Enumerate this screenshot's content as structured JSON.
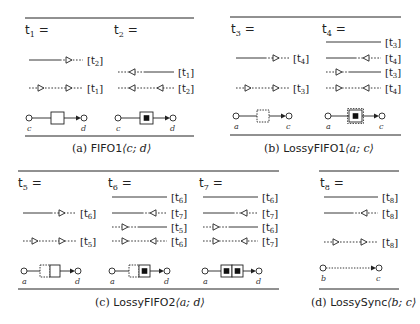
{
  "panels": [
    {
      "id": "a",
      "rule_x": [
        25,
        194
      ],
      "rule_top_y": 18,
      "rule_bottom_y": 136,
      "caption_prefix": "(a) ",
      "caption_name": "FIFO1",
      "caption_args": "⟨c; d⟩",
      "caption_x": 72,
      "caption_y": 152,
      "terms": [
        {
          "label": "t",
          "sub": "1",
          "x": 25,
          "y": 34,
          "rows": [
            {
              "y": 60,
              "x0": 29,
              "x1": 83,
              "pattern": [
                [
                  "solid",
                  29,
                  60
                ],
                [
                  "dot",
                  60,
                  83
                ]
              ],
              "arrows": [
                {
                  "x": 69,
                  "dir": "right"
                }
              ],
              "ref_t": "t",
              "ref_sub": "2",
              "ref_x": 87
            },
            {
              "y": 88,
              "x0": 29,
              "x1": 83,
              "pattern": [
                [
                  "dot",
                  29,
                  83
                ]
              ],
              "arrows": [
                {
                  "x": 41,
                  "dir": "right"
                },
                {
                  "x": 69,
                  "dir": "right"
                }
              ],
              "ref_t": "t",
              "ref_sub": "1",
              "ref_x": 87
            }
          ],
          "connector": {
            "y": 118,
            "src_x": 29,
            "snk_x": 84,
            "buffers": [
              {
                "x": 51,
                "w": 13,
                "style": "solid",
                "full": false
              }
            ],
            "src_label": "c",
            "snk_label": "d",
            "label_y": 131
          }
        },
        {
          "label": "t",
          "sub": "2",
          "x": 114,
          "y": 34,
          "rows": [
            {
              "y": 72,
              "x0": 118,
              "x1": 174,
              "pattern": [
                [
                  "dot",
                  118,
                  144
                ],
                [
                  "solid",
                  144,
                  174
                ]
              ],
              "arrows": [
                {
                  "x": 132,
                  "dir": "left"
                }
              ],
              "ref_t": "t",
              "ref_sub": "1",
              "ref_x": 178
            },
            {
              "y": 88,
              "x0": 118,
              "x1": 174,
              "pattern": [
                [
                  "dot",
                  118,
                  174
                ]
              ],
              "arrows": [
                {
                  "x": 132,
                  "dir": "left"
                },
                {
                  "x": 160,
                  "dir": "left"
                }
              ],
              "ref_t": "t",
              "ref_sub": "2",
              "ref_x": 178
            }
          ],
          "connector": {
            "y": 118,
            "src_x": 118,
            "snk_x": 173,
            "buffers": [
              {
                "x": 140,
                "w": 13,
                "style": "solid",
                "full": true
              }
            ],
            "src_label": "c",
            "snk_label": "d",
            "label_y": 131
          }
        }
      ]
    },
    {
      "id": "b",
      "rule_x": [
        230,
        401
      ],
      "rule_top_y": 17,
      "rule_bottom_y": 135,
      "caption_prefix": "(b) ",
      "caption_name": "LossyFIFO1",
      "caption_args": "⟨a; c⟩",
      "caption_x": 264,
      "caption_y": 152,
      "terms": [
        {
          "label": "t",
          "sub": "3",
          "x": 231,
          "y": 33,
          "rows": [
            {
              "y": 58,
              "x0": 236,
              "x1": 289,
              "pattern": [
                [
                  "solid",
                  236,
                  265
                ],
                [
                  "dot",
                  265,
                  289
                ]
              ],
              "arrows": [
                {
                  "x": 276,
                  "dir": "right"
                }
              ],
              "ref_t": "t",
              "ref_sub": "4",
              "ref_x": 293
            },
            {
              "y": 88,
              "x0": 236,
              "x1": 289,
              "pattern": [
                [
                  "dot",
                  236,
                  289
                ]
              ],
              "arrows": [
                {
                  "x": 248,
                  "dir": "right"
                },
                {
                  "x": 276,
                  "dir": "right"
                }
              ],
              "ref_t": "t",
              "ref_sub": "3",
              "ref_x": 293
            }
          ],
          "connector": {
            "y": 116,
            "src_x": 236,
            "snk_x": 289,
            "buffers": [
              {
                "x": 257,
                "w": 12,
                "style": "dashed",
                "full": false
              }
            ],
            "src_label": "a",
            "snk_label": "c",
            "label_y": 129
          }
        },
        {
          "label": "t",
          "sub": "4",
          "x": 322,
          "y": 33,
          "rows": [
            {
              "y": 42,
              "x0": 326,
              "x1": 381,
              "pattern": [
                [
                  "solid",
                  326,
                  381
                ]
              ],
              "arrows": [],
              "ref_t": "t",
              "ref_sub": "3",
              "ref_x": 385
            },
            {
              "y": 58,
              "x0": 326,
              "x1": 381,
              "pattern": [
                [
                  "solid",
                  326,
                  355
                ],
                [
                  "dot",
                  355,
                  381
                ]
              ],
              "arrows": [
                {
                  "x": 366,
                  "dir": "left"
                }
              ],
              "ref_t": "t",
              "ref_sub": "4",
              "ref_x": 385
            },
            {
              "y": 72,
              "x0": 326,
              "x1": 381,
              "pattern": [
                [
                  "dot",
                  326,
                  350
                ],
                [
                  "solid",
                  350,
                  381
                ]
              ],
              "arrows": [
                {
                  "x": 339,
                  "dir": "right"
                }
              ],
              "ref_t": "t",
              "ref_sub": "3",
              "ref_x": 385
            },
            {
              "y": 88,
              "x0": 326,
              "x1": 381,
              "pattern": [
                [
                  "dot",
                  326,
                  381
                ]
              ],
              "arrows": [
                {
                  "x": 339,
                  "dir": "right"
                },
                {
                  "x": 366,
                  "dir": "left"
                }
              ],
              "ref_t": "t",
              "ref_sub": "4",
              "ref_x": 385
            }
          ],
          "connector": {
            "y": 116,
            "src_x": 328,
            "snk_x": 382,
            "buffers": [
              {
                "x": 349,
                "w": 13,
                "style": "dashed-outer",
                "full": true
              }
            ],
            "src_label": "a",
            "snk_label": "c",
            "label_y": 129
          }
        }
      ]
    },
    {
      "id": "c",
      "rule_x": [
        18,
        279
      ],
      "rule_top_y": 171,
      "rule_bottom_y": 289,
      "caption_prefix": "(c) ",
      "caption_name": "LossyFIFO2",
      "caption_args": "⟨a; d⟩",
      "caption_x": 95,
      "caption_y": 306,
      "terms": [
        {
          "label": "t",
          "sub": "5",
          "x": 18,
          "y": 187,
          "rows": [
            {
              "y": 213,
              "x0": 23,
              "x1": 76,
              "pattern": [
                [
                  "solid",
                  23,
                  51
                ],
                [
                  "dot",
                  51,
                  76
                ]
              ],
              "arrows": [
                {
                  "x": 62,
                  "dir": "right"
                }
              ],
              "ref_t": "t",
              "ref_sub": "6",
              "ref_x": 80
            },
            {
              "y": 241,
              "x0": 23,
              "x1": 76,
              "pattern": [
                [
                  "dot",
                  23,
                  76
                ]
              ],
              "arrows": [
                {
                  "x": 35,
                  "dir": "right"
                },
                {
                  "x": 62,
                  "dir": "right"
                }
              ],
              "ref_t": "t",
              "ref_sub": "5",
              "ref_x": 80
            }
          ],
          "connector": {
            "y": 271,
            "src_x": 24,
            "snk_x": 78,
            "buffers": [
              {
                "x": 40,
                "w": 10,
                "style": "dashed",
                "full": false
              },
              {
                "x": 50,
                "w": 10,
                "style": "solid",
                "full": false
              }
            ],
            "src_label": "a",
            "snk_label": "d",
            "label_y": 284
          }
        },
        {
          "label": "t",
          "sub": "6",
          "x": 108,
          "y": 187,
          "rows": [
            {
              "y": 197,
              "x0": 112,
              "x1": 167,
              "pattern": [
                [
                  "solid",
                  112,
                  167
                ]
              ],
              "arrows": [],
              "ref_t": "t",
              "ref_sub": "6",
              "ref_x": 171
            },
            {
              "y": 213,
              "x0": 112,
              "x1": 167,
              "pattern": [
                [
                  "solid",
                  112,
                  142
                ],
                [
                  "dot",
                  142,
                  167
                ]
              ],
              "arrows": [
                {
                  "x": 153,
                  "dir": "left"
                }
              ],
              "ref_t": "t",
              "ref_sub": "7",
              "ref_x": 171
            },
            {
              "y": 227,
              "x0": 112,
              "x1": 167,
              "pattern": [
                [
                  "dot",
                  112,
                  138
                ],
                [
                  "solid",
                  138,
                  167
                ]
              ],
              "arrows": [
                {
                  "x": 125,
                  "dir": "right"
                }
              ],
              "ref_t": "t",
              "ref_sub": "5",
              "ref_x": 171
            },
            {
              "y": 241,
              "x0": 112,
              "x1": 167,
              "pattern": [
                [
                  "dot",
                  112,
                  167
                ]
              ],
              "arrows": [
                {
                  "x": 125,
                  "dir": "right"
                },
                {
                  "x": 153,
                  "dir": "left"
                }
              ],
              "ref_t": "t",
              "ref_sub": "6",
              "ref_x": 171
            }
          ],
          "connector": {
            "y": 271,
            "src_x": 112,
            "snk_x": 167,
            "buffers": [
              {
                "x": 129,
                "w": 10,
                "style": "dashed",
                "full": false
              },
              {
                "x": 139,
                "w": 11,
                "style": "solid",
                "full": true
              }
            ],
            "src_label": "a",
            "snk_label": "d",
            "label_y": 284
          }
        },
        {
          "label": "t",
          "sub": "7",
          "x": 199,
          "y": 187,
          "rows": [
            {
              "y": 197,
              "x0": 203,
              "x1": 258,
              "pattern": [
                [
                  "solid",
                  203,
                  258
                ]
              ],
              "arrows": [],
              "ref_t": "t",
              "ref_sub": "6",
              "ref_x": 262
            },
            {
              "y": 213,
              "x0": 203,
              "x1": 258,
              "pattern": [
                [
                  "solid",
                  203,
                  233
                ],
                [
                  "dot",
                  233,
                  258
                ]
              ],
              "arrows": [
                {
                  "x": 244,
                  "dir": "left"
                }
              ],
              "ref_t": "t",
              "ref_sub": "7",
              "ref_x": 262
            },
            {
              "y": 227,
              "x0": 203,
              "x1": 258,
              "pattern": [
                [
                  "dot",
                  203,
                  229
                ],
                [
                  "solid",
                  229,
                  258
                ]
              ],
              "arrows": [
                {
                  "x": 216,
                  "dir": "right"
                }
              ],
              "ref_t": "t",
              "ref_sub": "6",
              "ref_x": 262
            },
            {
              "y": 241,
              "x0": 203,
              "x1": 258,
              "pattern": [
                [
                  "dot",
                  203,
                  258
                ]
              ],
              "arrows": [
                {
                  "x": 216,
                  "dir": "right"
                },
                {
                  "x": 244,
                  "dir": "left"
                }
              ],
              "ref_t": "t",
              "ref_sub": "7",
              "ref_x": 262
            }
          ],
          "connector": {
            "y": 271,
            "src_x": 205,
            "snk_x": 259,
            "buffers": [
              {
                "x": 221,
                "w": 11,
                "style": "solid",
                "full": true
              },
              {
                "x": 232,
                "w": 11,
                "style": "solid",
                "full": true
              }
            ],
            "src_label": "a",
            "snk_label": "d",
            "label_y": 284
          }
        }
      ]
    },
    {
      "id": "d",
      "rule_x": [
        319,
        399
      ],
      "rule_top_y": 171,
      "rule_bottom_y": 289,
      "caption_prefix": "(d) ",
      "caption_name": "LossySync",
      "caption_args": "⟨b; c⟩",
      "caption_x": 311,
      "caption_y": 306,
      "terms": [
        {
          "label": "t",
          "sub": "8",
          "x": 320,
          "y": 187,
          "rows": [
            {
              "y": 197,
              "x0": 324,
              "x1": 378,
              "pattern": [
                [
                  "solid",
                  324,
                  378
                ]
              ],
              "arrows": [],
              "ref_t": "t",
              "ref_sub": "8",
              "ref_x": 382
            },
            {
              "y": 213,
              "x0": 324,
              "x1": 378,
              "pattern": [
                [
                  "solid",
                  324,
                  352
                ],
                [
                  "dot",
                  352,
                  378
                ]
              ],
              "arrows": [
                {
                  "x": 364,
                  "dir": "left"
                }
              ],
              "ref_t": "t",
              "ref_sub": "8",
              "ref_x": 382
            },
            {
              "y": 242,
              "x0": 324,
              "x1": 378,
              "pattern": [
                [
                  "dot",
                  324,
                  378
                ]
              ],
              "arrows": [
                {
                  "x": 336,
                  "dir": "right"
                },
                {
                  "x": 364,
                  "dir": "right"
                }
              ],
              "ref_t": "t",
              "ref_sub": "8",
              "ref_x": 382
            }
          ],
          "connector": {
            "y": 268,
            "src_x": 323,
            "snk_x": 379,
            "buffers": [],
            "lossy_line": true,
            "src_label": "b",
            "snk_label": "c",
            "label_y": 281
          }
        }
      ]
    }
  ]
}
